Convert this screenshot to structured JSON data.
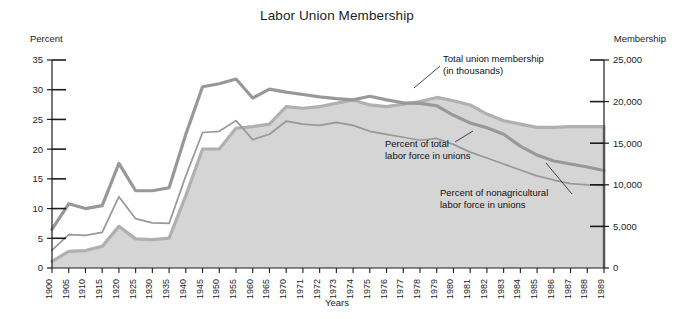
{
  "chart_data": {
    "type": "area",
    "title": "Labor Union Membership",
    "xlabel": "Years",
    "ylabel": "Percent",
    "y2label": "Membership",
    "grid": false,
    "legend_position": "inline-annotations",
    "ylim": [
      0,
      35
    ],
    "y2lim": [
      0,
      25000
    ],
    "yticks": [
      "0",
      "5",
      "10",
      "15",
      "20",
      "25",
      "30",
      "35"
    ],
    "y2ticks": [
      "0",
      "5,000",
      "10,000",
      "15,000",
      "20,000",
      "25,000"
    ],
    "x": [
      1900,
      1905,
      1910,
      1915,
      1920,
      1925,
      1930,
      1935,
      1940,
      1945,
      1950,
      1955,
      1960,
      1965,
      1970,
      1971,
      1972,
      1973,
      1974,
      1975,
      1976,
      1977,
      1978,
      1979,
      1980,
      1981,
      1982,
      1983,
      1984,
      1985,
      1986,
      1987,
      1988,
      1989
    ],
    "xticklabels": [
      "1900",
      "1905",
      "1910",
      "1915",
      "1920",
      "1925",
      "1930",
      "1935",
      "1940",
      "1945",
      "1950",
      "1955",
      "1960",
      "1965",
      "1970",
      "1971",
      "1972",
      "1973",
      "1974",
      "1975",
      "1976",
      "1977",
      "1978",
      "1979",
      "1980",
      "1981",
      "1982",
      "1983",
      "1984",
      "1985",
      "1986",
      "1987",
      "1988",
      "1989"
    ],
    "series": [
      {
        "name": "Percent of nonagricultural labor force in unions",
        "axis": "left",
        "style": "thick-gray-line",
        "units": "percent",
        "values": [
          6.5,
          10.8,
          10.0,
          10.5,
          17.6,
          13.0,
          13.0,
          13.5,
          22.5,
          30.5,
          31.0,
          31.8,
          28.6,
          30.1,
          29.6,
          29.2,
          28.8,
          28.5,
          28.3,
          28.9,
          28.3,
          27.8,
          27.7,
          27.3,
          25.7,
          24.4,
          23.6,
          22.5,
          20.5,
          19.0,
          18.0,
          17.5,
          17.0,
          16.4
        ]
      },
      {
        "name": "Percent of total labor force in unions",
        "axis": "left",
        "style": "thin-gray-line",
        "units": "percent",
        "values": [
          3.0,
          5.6,
          5.5,
          6.0,
          12.0,
          8.3,
          7.6,
          7.5,
          15.5,
          22.8,
          23.0,
          24.8,
          21.6,
          22.5,
          24.7,
          24.2,
          24.0,
          24.5,
          24.0,
          23.0,
          22.5,
          22.0,
          21.5,
          21.8,
          20.8,
          19.5,
          18.5,
          17.5,
          16.5,
          15.5,
          14.8,
          14.2,
          14.0,
          13.9
        ]
      },
      {
        "name": "Total union membership (in thousands)",
        "axis": "right",
        "style": "filled-area-gray",
        "units": "thousands",
        "values": [
          800,
          2000,
          2100,
          2600,
          5000,
          3500,
          3400,
          3600,
          8700,
          14300,
          14300,
          16800,
          17000,
          17300,
          19400,
          19200,
          19400,
          19800,
          20200,
          19600,
          19400,
          19700,
          20000,
          20500,
          20100,
          19600,
          18500,
          17700,
          17300,
          16900,
          16900,
          17000,
          17000,
          17000
        ]
      }
    ],
    "annotations": [
      {
        "id": "annot-total-membership",
        "lines": [
          "Total union membership",
          "(in thousands)"
        ]
      },
      {
        "id": "annot-percent-total",
        "lines": [
          "Percent of total",
          "labor force in unions"
        ]
      },
      {
        "id": "annot-percent-nonag",
        "lines": [
          "Percent of nonagricultural",
          "labor force in unions"
        ]
      }
    ],
    "colors": {
      "area_fill": "#d5d5d5",
      "line_dark": "#989898",
      "line_mid": "#b0b0b0",
      "axis": "#1c1c1c",
      "text": "#1c1c1c",
      "background": "#ffffff"
    }
  }
}
